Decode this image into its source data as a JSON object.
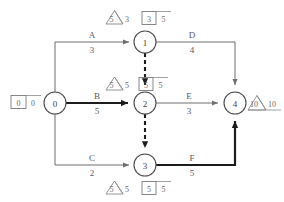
{
  "diagram": {
    "type": "cpm-network",
    "colors": {
      "background": "#ffffff",
      "node_stroke": "#4a4a4a",
      "edge_normal": "#6e6e6e",
      "edge_critical": "#1c1c1c",
      "dummy_edge": "#1c1c1c",
      "annotation": "#8a8a8a",
      "text": "#4a4a4a"
    },
    "nodes": [
      {
        "id": "node-0",
        "label": "0",
        "cx": 55,
        "cy": 103,
        "r": 11
      },
      {
        "id": "node-1",
        "label": "1",
        "cx": 145,
        "cy": 42,
        "r": 11
      },
      {
        "id": "node-2",
        "label": "2",
        "cx": 145,
        "cy": 103,
        "r": 11
      },
      {
        "id": "node-3",
        "label": "3",
        "cx": 145,
        "cy": 165,
        "r": 11
      },
      {
        "id": "node-4",
        "label": "4",
        "cx": 235,
        "cy": 103,
        "r": 11
      }
    ],
    "activities": [
      {
        "id": "activity-a",
        "name": "A",
        "duration": "3",
        "from": "0",
        "to": "1",
        "critical": false,
        "dummy": false
      },
      {
        "id": "activity-b",
        "name": "B",
        "duration": "5",
        "from": "0",
        "to": "2",
        "critical": true,
        "dummy": false
      },
      {
        "id": "activity-c",
        "name": "C",
        "duration": "2",
        "from": "0",
        "to": "3",
        "critical": false,
        "dummy": false
      },
      {
        "id": "activity-d",
        "name": "D",
        "duration": "4",
        "from": "1",
        "to": "4",
        "critical": false,
        "dummy": false
      },
      {
        "id": "activity-e",
        "name": "E",
        "duration": "3",
        "from": "2",
        "to": "4",
        "critical": false,
        "dummy": false
      },
      {
        "id": "activity-f",
        "name": "F",
        "duration": "5",
        "from": "3",
        "to": "4",
        "critical": true,
        "dummy": false
      }
    ],
    "dummy_activities": [
      {
        "id": "dummy-1-2",
        "from": "1",
        "to": "2"
      },
      {
        "id": "dummy-2-3",
        "from": "2",
        "to": "3"
      }
    ],
    "annotations": [
      {
        "id": "annotation-node-0",
        "node": "0",
        "shape": "box",
        "left": "0",
        "right": "0"
      },
      {
        "id": "annotation-node-1",
        "node": "1",
        "shape": "triangle-and-box",
        "triangle_left": "5",
        "triangle_right": "3",
        "box_left": "3",
        "box_right": "5"
      },
      {
        "id": "annotation-node-2",
        "node": "2",
        "shape": "triangle-and-box",
        "triangle_left": "5",
        "triangle_right": "5",
        "box_left": "5",
        "box_right": "5"
      },
      {
        "id": "annotation-node-3",
        "node": "3",
        "shape": "triangle-and-box",
        "triangle_left": "5",
        "triangle_right": "5",
        "box_left": "5",
        "box_right": "5"
      },
      {
        "id": "annotation-node-4",
        "node": "4",
        "shape": "triangle",
        "triangle_left": "10",
        "triangle_right": "10"
      }
    ],
    "labels": {
      "node_0": "0",
      "node_1": "1",
      "node_2": "2",
      "node_3": "3",
      "node_4": "4",
      "act_a": "A",
      "dur_a": "3",
      "act_b": "B",
      "dur_b": "5",
      "act_c": "C",
      "dur_c": "2",
      "act_d": "D",
      "dur_d": "4",
      "act_e": "E",
      "dur_e": "3",
      "act_f": "F",
      "dur_f": "5",
      "ann0_left": "0",
      "ann0_right": "0",
      "ann1_tri_left": "5",
      "ann1_tri_right": "3",
      "ann1_box_left": "3",
      "ann1_box_right": "5",
      "ann2_tri_left": "5",
      "ann2_tri_right": "5",
      "ann2_box_left": "5",
      "ann2_box_right": "5",
      "ann3_tri_left": "5",
      "ann3_tri_right": "5",
      "ann3_box_left": "5",
      "ann3_box_right": "5",
      "ann4_tri_left": "10",
      "ann4_tri_right": "10"
    }
  }
}
